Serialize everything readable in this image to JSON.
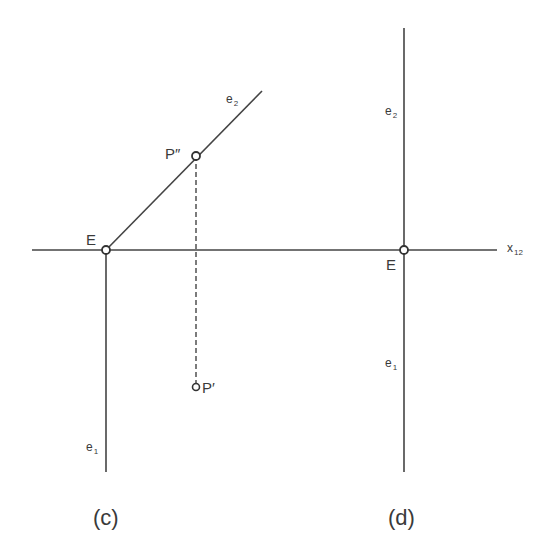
{
  "diagram": {
    "stroke_color": "#444444",
    "background": "#ffffff",
    "panels": [
      {
        "id": "c",
        "caption": "(c)",
        "labels": {
          "E": "E",
          "P_double_prime": "P″",
          "P_prime": "P′",
          "e2_base": "e",
          "e2_sub": "2",
          "e1_base": "e",
          "e1_sub": "1"
        }
      },
      {
        "id": "d",
        "caption": "(d)",
        "labels": {
          "E": "E",
          "e2_base": "e",
          "e2_sub": "2",
          "e1_base": "e",
          "e1_sub": "1",
          "axis_base": "x",
          "axis_sub": "12"
        }
      }
    ]
  }
}
